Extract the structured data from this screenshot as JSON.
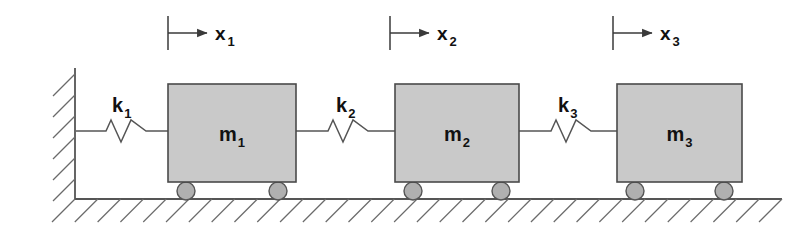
{
  "diagram": {
    "type": "mechanical-schematic",
    "canvas": {
      "width": 812,
      "height": 237,
      "background": "#ffffff"
    },
    "colors": {
      "block_fill": "#c9c9c9",
      "block_stroke": "#4a4a4a",
      "wheel_fill": "#b0b0b0",
      "wheel_stroke": "#555555",
      "line": "#555555",
      "hatch": "#6a6a6a",
      "text": "#111111"
    },
    "wall": {
      "name": "fixed-wall",
      "x": 75,
      "y_top": 68,
      "y_bottom": 200,
      "hatch_count": 6,
      "hatch_direction": "down-left"
    },
    "ground": {
      "name": "ground-surface",
      "y": 199,
      "x_start": 75,
      "x_end": 782,
      "hatch_count": 31,
      "hatch_direction": "down-left"
    },
    "masses": [
      {
        "label_main": "m",
        "label_sub": "1",
        "label_full": "m1",
        "x": 168,
        "y": 84,
        "width": 128,
        "height": 98,
        "wheels": [
          {
            "cx": 186,
            "cy": 191
          },
          {
            "cx": 278,
            "cy": 191
          }
        ],
        "wheel_radius": 9
      },
      {
        "label_main": "m",
        "label_sub": "2",
        "label_full": "m2",
        "x": 395,
        "y": 84,
        "width": 124,
        "height": 98,
        "wheels": [
          {
            "cx": 413,
            "cy": 191
          },
          {
            "cx": 501,
            "cy": 191
          }
        ],
        "wheel_radius": 9
      },
      {
        "label_main": "m",
        "label_sub": "3",
        "label_full": "m3",
        "x": 617,
        "y": 84,
        "width": 125,
        "height": 98,
        "wheels": [
          {
            "cx": 635,
            "cy": 191
          },
          {
            "cx": 724,
            "cy": 191
          }
        ],
        "wheel_radius": 9
      }
    ],
    "springs": [
      {
        "label_main": "k",
        "label_sub": "1",
        "label_full": "k1",
        "x_start": 76,
        "x_end": 168,
        "y": 131,
        "coil_x_start": 106,
        "coil_x_end": 146,
        "amplitude": 11,
        "label_x": 112,
        "label_y": 112
      },
      {
        "label_main": "k",
        "label_sub": "2",
        "label_full": "k2",
        "x_start": 296,
        "x_end": 395,
        "y": 131,
        "coil_x_start": 328,
        "coil_x_end": 368,
        "amplitude": 11,
        "label_x": 336,
        "label_y": 112
      },
      {
        "label_main": "k",
        "label_sub": "3",
        "label_full": "k3",
        "x_start": 519,
        "x_end": 617,
        "y": 131,
        "coil_x_start": 551,
        "coil_x_end": 591,
        "amplitude": 11,
        "label_x": 558,
        "label_y": 112
      }
    ],
    "displacements": [
      {
        "label_main": "x",
        "label_sub": "1",
        "label_full": "x1",
        "tick_x": 168,
        "tick_y_top": 16,
        "tick_y_bottom": 50,
        "arrow_y": 33,
        "arrow_x_start": 168,
        "arrow_x_end": 207,
        "label_x": 215,
        "label_y": 40
      },
      {
        "label_main": "x",
        "label_sub": "2",
        "label_full": "x2",
        "tick_x": 390,
        "tick_y_top": 16,
        "tick_y_bottom": 50,
        "arrow_y": 33,
        "arrow_x_start": 390,
        "arrow_x_end": 429,
        "label_x": 437,
        "label_y": 40
      },
      {
        "label_main": "x",
        "label_sub": "3",
        "label_full": "x3",
        "tick_x": 613,
        "tick_y_top": 16,
        "tick_y_bottom": 50,
        "arrow_y": 33,
        "arrow_x_start": 613,
        "arrow_x_end": 652,
        "label_x": 660,
        "label_y": 40
      }
    ]
  }
}
